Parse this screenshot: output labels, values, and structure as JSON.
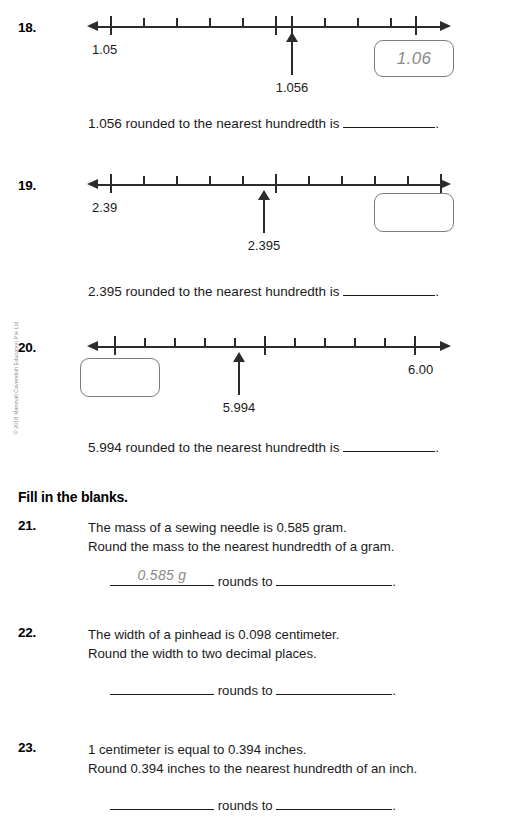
{
  "page": {
    "copyright": "© 2018 Marshall Cavendish Education Pte Ltd"
  },
  "numberline_questions": [
    {
      "number": "18.",
      "left_label": "1.05",
      "right_label": "",
      "pointer_label": "1.056",
      "answer_box_value": "1.06",
      "answer_box_side": "right",
      "sentence_prefix": "1.056 rounded to the nearest hundredth is",
      "sentence_suffix": "."
    },
    {
      "number": "19.",
      "left_label": "2.39",
      "right_label": "",
      "pointer_label": "2.395",
      "answer_box_value": "",
      "answer_box_side": "right",
      "sentence_prefix": "2.395 rounded to the nearest hundredth is",
      "sentence_suffix": "."
    },
    {
      "number": "20.",
      "left_label": "",
      "right_label": "6.00",
      "pointer_label": "5.994",
      "answer_box_value": "",
      "answer_box_side": "left",
      "sentence_prefix": "5.994 rounded to the nearest hundredth is",
      "sentence_suffix": "."
    }
  ],
  "fill_section": {
    "heading": "Fill in the blanks.",
    "rounds_to_label": "rounds to",
    "period": ".",
    "questions": [
      {
        "number": "21.",
        "line1": "The mass of a sewing needle is 0.585 gram.",
        "line2": "Round the mass to the nearest hundredth of a gram.",
        "answer_first": "0.585 g",
        "answer_second": ""
      },
      {
        "number": "22.",
        "line1": "The width of a pinhead is 0.098 centimeter.",
        "line2": "Round the width to two decimal places.",
        "answer_first": "",
        "answer_second": ""
      },
      {
        "number": "23.",
        "line1": "1 centimeter is equal to 0.394 inches.",
        "line2": "Round 0.394 inches to the nearest hundredth of an inch.",
        "answer_first": "",
        "answer_second": ""
      }
    ]
  }
}
